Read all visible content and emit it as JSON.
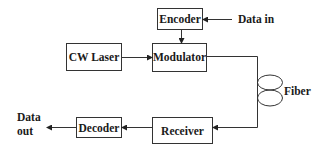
{
  "diagram": {
    "blocks": [
      {
        "id": "encoder",
        "label": "Encoder"
      },
      {
        "id": "cw_laser",
        "label": "CW Laser"
      },
      {
        "id": "modulator",
        "label": "Modulator"
      },
      {
        "id": "receiver",
        "label": "Receiver"
      },
      {
        "id": "decoder",
        "label": "Decoder"
      }
    ],
    "labels": {
      "data_in": "Data in",
      "fiber": "Fiber",
      "data_out_line1": "Data",
      "data_out_line2": "out"
    },
    "connections": [
      {
        "from": "data_in",
        "to": "encoder"
      },
      {
        "from": "encoder",
        "to": "modulator"
      },
      {
        "from": "cw_laser",
        "to": "modulator"
      },
      {
        "from": "modulator",
        "to": "fiber"
      },
      {
        "from": "fiber",
        "to": "receiver"
      },
      {
        "from": "receiver",
        "to": "decoder"
      },
      {
        "from": "decoder",
        "to": "data_out"
      }
    ]
  }
}
